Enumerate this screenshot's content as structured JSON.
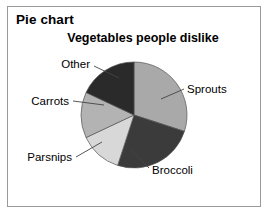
{
  "panel": {
    "heading": "Pie chart"
  },
  "chart_data": {
    "type": "pie",
    "title": "Vegetables people dislike",
    "xlabel": "",
    "ylabel": "",
    "legend_position": "none",
    "labels_position": "outside-with-leader-lines",
    "grid": false,
    "categories": [
      "Sprouts",
      "Broccoli",
      "Parsnips",
      "Carrots",
      "Other"
    ],
    "values": [
      30,
      25,
      13,
      14,
      18
    ],
    "units": "percent",
    "slices": [
      {
        "label": "Sprouts",
        "value": 30,
        "color": "#a9a9a9",
        "start_angle_deg": 0,
        "end_angle_deg": 108
      },
      {
        "label": "Broccoli",
        "value": 25,
        "color": "#3b3b3b",
        "start_angle_deg": 108,
        "end_angle_deg": 198
      },
      {
        "label": "Parsnips",
        "value": 13,
        "color": "#d8d8d8",
        "start_angle_deg": 198,
        "end_angle_deg": 245
      },
      {
        "label": "Carrots",
        "value": 14,
        "color": "#b3b3b3",
        "start_angle_deg": 245,
        "end_angle_deg": 295
      },
      {
        "label": "Other",
        "value": 18,
        "color": "#2a2a2a",
        "start_angle_deg": 295,
        "end_angle_deg": 360
      }
    ],
    "colors": {
      "sprouts": "#a9a9a9",
      "broccoli": "#3b3b3b",
      "parsnips": "#d8d8d8",
      "carrots": "#b3b3b3",
      "other": "#2a2a2a",
      "slice_outline": "#555555",
      "leader_line": "#444444",
      "frame_border": "#9a9a9a",
      "background": "#ffffff",
      "text": "#000000"
    }
  }
}
